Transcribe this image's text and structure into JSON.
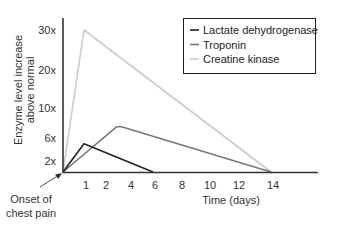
{
  "chart_data": {
    "type": "line",
    "title": "",
    "xlabel": "Time (days)",
    "ylabel_lines": [
      "Enzyme level increase",
      "above normal"
    ],
    "ylabel": "Enzyme level increase above normal",
    "x_ticks": [
      1,
      2,
      4,
      6,
      8,
      10,
      12,
      14
    ],
    "x_tick_labels": [
      "1",
      "2",
      "4",
      "6",
      "8",
      "10",
      "12",
      "14"
    ],
    "y_ticks": [
      2,
      6,
      10,
      20,
      30
    ],
    "y_tick_labels": [
      "2x",
      "6x",
      "10x",
      "20x",
      "30x"
    ],
    "xlim": [
      0,
      16
    ],
    "ylim": [
      0,
      32
    ],
    "grid": false,
    "legend_position": "top-right",
    "annotation": {
      "text_lines": [
        "Onset of",
        "chest pain"
      ],
      "points_to": {
        "x": 0,
        "y": 0
      }
    },
    "series": [
      {
        "name": "Lactate dehydrogenase",
        "color": "#222222",
        "points": [
          [
            0,
            0
          ],
          [
            1,
            5
          ],
          [
            6,
            0
          ]
        ]
      },
      {
        "name": "Troponin",
        "color": "#777777",
        "points": [
          [
            0,
            0
          ],
          [
            3,
            7.5
          ],
          [
            3.4,
            7.5
          ],
          [
            14,
            0
          ]
        ]
      },
      {
        "name": "Creatine kinase",
        "color": "#cccccc",
        "points": [
          [
            0,
            0
          ],
          [
            1,
            30
          ],
          [
            14,
            0
          ]
        ]
      }
    ]
  }
}
